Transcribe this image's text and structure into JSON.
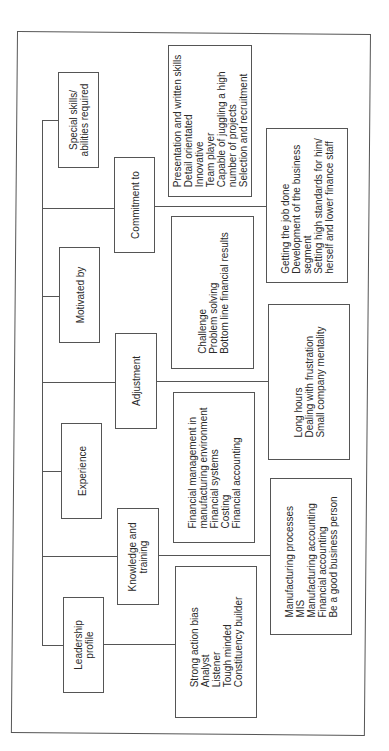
{
  "diagram": {
    "type": "hierarchy-tree",
    "orientation": "rotated-90-ccw",
    "categories": [
      {
        "id": "leadership",
        "label": [
          "Leadership",
          "profile"
        ],
        "items": [
          "Strong action bias",
          "Analyst",
          "Listener",
          "Tough minded",
          "Constituency builder"
        ]
      },
      {
        "id": "knowledge",
        "label": [
          "Knowledge and",
          "training"
        ],
        "items": [
          "Manufacturing processes",
          "MIS",
          "Manufacturing accounting",
          "Financial accounting",
          "Be a good business person"
        ]
      },
      {
        "id": "experience",
        "label": [
          "Experience"
        ],
        "items": [
          "Financial management in",
          "manufacturing environment",
          "Financial systems",
          "Costing",
          "Financial accounting"
        ]
      },
      {
        "id": "adjustment",
        "label": [
          "Adjustment"
        ],
        "items": [
          "Long hours",
          "Dealing with frustration",
          "Small company mentality"
        ]
      },
      {
        "id": "motivated",
        "label": [
          "Motivated by"
        ],
        "items": [
          "Challenge",
          "Problem solving",
          "Bottom line financial results"
        ]
      },
      {
        "id": "commitment",
        "label": [
          "Commitment to"
        ],
        "items": [
          "Getting the job done",
          "Development of the business",
          "segment",
          "Setting high standards for him/",
          "herself and lower finance staff"
        ]
      },
      {
        "id": "special",
        "label": [
          "Special skills/",
          "abilities required"
        ],
        "items": [
          "Presentation and written skills",
          "Detail orientated",
          "Innovative",
          "Team player",
          "Capable of juggling a high",
          "number of projects",
          "Selection and recruitment"
        ]
      }
    ]
  }
}
